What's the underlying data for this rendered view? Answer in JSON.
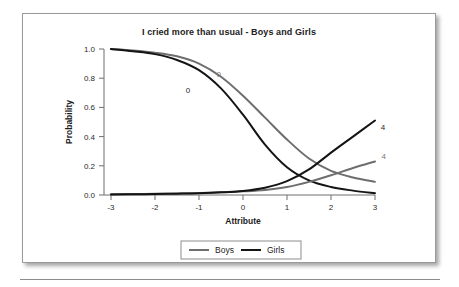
{
  "figure": {
    "title": "I cried more than usual - Boys and Girls"
  },
  "axes": {
    "x_label": "Attribute",
    "y_label": "Probability",
    "x_ticks": [
      "-3",
      "-2",
      "-1",
      "0",
      "1",
      "2",
      "3"
    ],
    "y_ticks": [
      "0.0",
      "0.2",
      "0.4",
      "0.6",
      "0.8",
      "1.0"
    ]
  },
  "legend": {
    "items": [
      {
        "label": "Boys",
        "color": "#6e6e6e"
      },
      {
        "label": "Girls",
        "color": "#141414"
      }
    ]
  },
  "annotations": [
    {
      "text": "0",
      "series": "Boys",
      "color": "#7a7a7a",
      "x": -0.55,
      "y": 0.805
    },
    {
      "text": "0",
      "series": "Girls",
      "color": "#2a2a2a",
      "x": -1.25,
      "y": 0.7
    },
    {
      "text": "4",
      "series": "Girls",
      "color": "#2a2a2a",
      "x": 3.18,
      "y": 0.445
    },
    {
      "text": "4",
      "series": "Boys",
      "color": "#7a7a7a",
      "x": 3.2,
      "y": 0.245
    }
  ],
  "chart_data": {
    "type": "line",
    "title": "I cried more than usual - Boys and Girls",
    "xlabel": "Attribute",
    "ylabel": "Probability",
    "xlim": [
      -3,
      3
    ],
    "ylim": [
      0.0,
      1.0
    ],
    "grid": false,
    "legend_position": "bottom",
    "x": [
      -3,
      -2.5,
      -2,
      -1.5,
      -1,
      -0.5,
      0,
      0.5,
      1,
      1.5,
      2,
      2.5,
      3
    ],
    "series": [
      {
        "name": "Boys - 0",
        "group": "Boys",
        "category": "0",
        "color": "#6e6e6e",
        "values": [
          1.0,
          0.99,
          0.975,
          0.95,
          0.9,
          0.81,
          0.68,
          0.53,
          0.38,
          0.25,
          0.165,
          0.12,
          0.09
        ]
      },
      {
        "name": "Girls - 0",
        "group": "Girls",
        "category": "0",
        "color": "#141414",
        "values": [
          1.0,
          0.985,
          0.965,
          0.925,
          0.855,
          0.73,
          0.55,
          0.345,
          0.19,
          0.1,
          0.055,
          0.03,
          0.012
        ]
      },
      {
        "name": "Boys - 4",
        "group": "Boys",
        "category": "4",
        "color": "#6e6e6e",
        "values": [
          0.005,
          0.006,
          0.008,
          0.01,
          0.013,
          0.018,
          0.025,
          0.035,
          0.055,
          0.09,
          0.135,
          0.185,
          0.23
        ]
      },
      {
        "name": "Girls - 4",
        "group": "Girls",
        "category": "4",
        "color": "#141414",
        "values": [
          0.004,
          0.005,
          0.007,
          0.009,
          0.012,
          0.018,
          0.028,
          0.05,
          0.095,
          0.175,
          0.29,
          0.4,
          0.51
        ]
      }
    ]
  }
}
